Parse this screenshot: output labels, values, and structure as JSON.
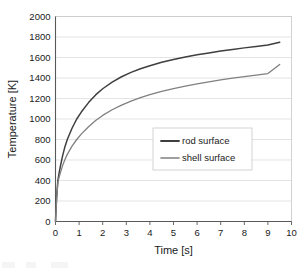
{
  "chart_data": {
    "type": "line",
    "title": "",
    "xlabel": "Time [s]",
    "ylabel": "Temperature [K]",
    "xlim": [
      0,
      10
    ],
    "ylim": [
      0,
      2000
    ],
    "xticks": [
      "0",
      "1",
      "2",
      "3",
      "4",
      "5",
      "6",
      "7",
      "8",
      "9",
      "10"
    ],
    "yticks": [
      "0",
      "200",
      "400",
      "600",
      "800",
      "1000",
      "1200",
      "1400",
      "1600",
      "1800",
      "2000"
    ],
    "grid": "horizontal",
    "legend_position": "center-right",
    "series": [
      {
        "name": "rod surface",
        "color": "#3f3f3f",
        "x": [
          0,
          0.05,
          0.1,
          0.15,
          0.2,
          0.3,
          0.4,
          0.5,
          0.7,
          0.9,
          1.1,
          1.4,
          1.7,
          2.0,
          2.4,
          2.8,
          3.2,
          3.6,
          4.0,
          4.5,
          5.0,
          5.5,
          6.0,
          6.5,
          7.0,
          7.5,
          8.0,
          8.5,
          9.0,
          9.5
        ],
        "y": [
          0,
          250,
          400,
          470,
          530,
          640,
          730,
          800,
          910,
          1000,
          1070,
          1160,
          1235,
          1295,
          1360,
          1412,
          1455,
          1490,
          1520,
          1553,
          1581,
          1605,
          1626,
          1645,
          1663,
          1679,
          1694,
          1708,
          1721,
          1748
        ]
      },
      {
        "name": "shell surface",
        "color": "#808080",
        "x": [
          0,
          0.05,
          0.1,
          0.15,
          0.2,
          0.3,
          0.4,
          0.5,
          0.7,
          0.9,
          1.1,
          1.4,
          1.7,
          2.0,
          2.4,
          2.8,
          3.2,
          3.6,
          4.0,
          4.5,
          5.0,
          5.5,
          6.0,
          6.5,
          7.0,
          7.5,
          8.0,
          8.5,
          9.0,
          9.5
        ],
        "y": [
          0,
          230,
          380,
          430,
          470,
          545,
          605,
          655,
          735,
          800,
          855,
          925,
          985,
          1035,
          1090,
          1135,
          1175,
          1208,
          1238,
          1270,
          1297,
          1321,
          1343,
          1363,
          1381,
          1398,
          1414,
          1429,
          1443,
          1532
        ]
      }
    ]
  }
}
